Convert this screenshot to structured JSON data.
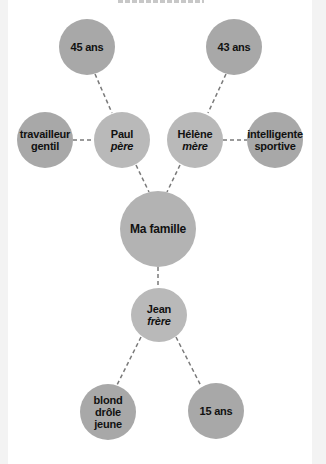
{
  "diagram": {
    "center": {
      "label": "Ma famille"
    },
    "members": [
      {
        "id": "paul",
        "name": "Paul",
        "role": "père",
        "traits": [
          "travailleur",
          "gentil"
        ],
        "age": "45 ans"
      },
      {
        "id": "helene",
        "name": "Hélène",
        "role": "mère",
        "traits": [
          "intelligente",
          "sportive"
        ],
        "age": "43 ans"
      },
      {
        "id": "jean",
        "name": "Jean",
        "role": "frère",
        "traits": [
          "blond",
          "drôle",
          "jeune"
        ],
        "age": "15 ans"
      }
    ]
  },
  "colors": {
    "outer_node": "#a8a8a8",
    "member_node": "#b9b9b9",
    "center_node": "#b3b3b3",
    "link": "#7a7a7a",
    "text": "#111111"
  }
}
